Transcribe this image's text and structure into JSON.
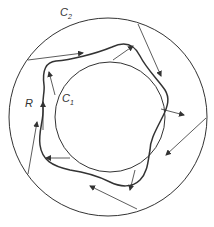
{
  "figure": {
    "labels": {
      "outer_curve": "C",
      "outer_curve_sub": "2",
      "inner_curve": "C",
      "inner_curve_sub": "1",
      "region": "R"
    },
    "colors": {
      "stroke": "#333333",
      "background": "#ffffff"
    }
  }
}
